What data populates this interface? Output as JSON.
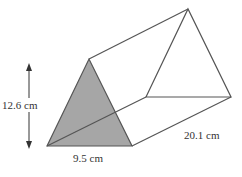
{
  "figure": {
    "type": "triangular-prism",
    "labels": {
      "height": "12.6 cm",
      "base": "9.5 cm",
      "length": "20.1 cm"
    },
    "colors": {
      "face_fill": "#a6a6a6",
      "edge": "#555555",
      "text": "#333333",
      "background": "#ffffff"
    }
  }
}
